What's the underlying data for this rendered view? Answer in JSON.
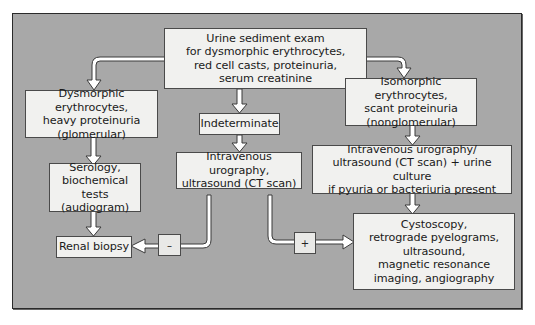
{
  "diagram": {
    "type": "flowchart",
    "colors": {
      "panel": "#a8a8a8",
      "box": "#f1f1ef",
      "border": "#4a4a4a",
      "arrow_fill": "#ffffff"
    },
    "nodes": {
      "start": "Urine sediment exam\nfor dysmorphic erythrocytes,\nred cell casts, proteinuria,\nserum creatinine",
      "glomerular": "Dysmorphic erythrocytes,\nheavy proteinuria\n(glomerular)",
      "indeterminate": "Indeterminate",
      "nonglomerular": "Isomorphic erythrocytes,\nscant proteinuria\n(nonglomerular)",
      "serology": "Serology,\nbiochemical tests\n(audiogram)",
      "iv_urography_mid": "Intravenous urography,\nultrasound (CT scan)",
      "iv_urography_right": "Intravenous urography/\nultrasound (CT scan) + urine culture\nif pyuria or bacteriuria present",
      "renal_biopsy": "Renal biopsy",
      "cystoscopy": "Cystoscopy,\nretrograde pyelograms,\nultrasound,\nmagnetic resonance\nimaging, angiography"
    },
    "edge_labels": {
      "negative": "–",
      "positive": "+"
    },
    "edges": [
      {
        "from": "start",
        "to": "glomerular"
      },
      {
        "from": "start",
        "to": "indeterminate"
      },
      {
        "from": "start",
        "to": "nonglomerular"
      },
      {
        "from": "glomerular",
        "to": "serology"
      },
      {
        "from": "serology",
        "to": "renal_biopsy"
      },
      {
        "from": "indeterminate",
        "to": "iv_urography_mid"
      },
      {
        "from": "iv_urography_mid",
        "to": "renal_biopsy",
        "label": "–"
      },
      {
        "from": "iv_urography_mid",
        "to": "cystoscopy",
        "label": "+"
      },
      {
        "from": "nonglomerular",
        "to": "iv_urography_right"
      },
      {
        "from": "iv_urography_right",
        "to": "cystoscopy"
      }
    ]
  }
}
